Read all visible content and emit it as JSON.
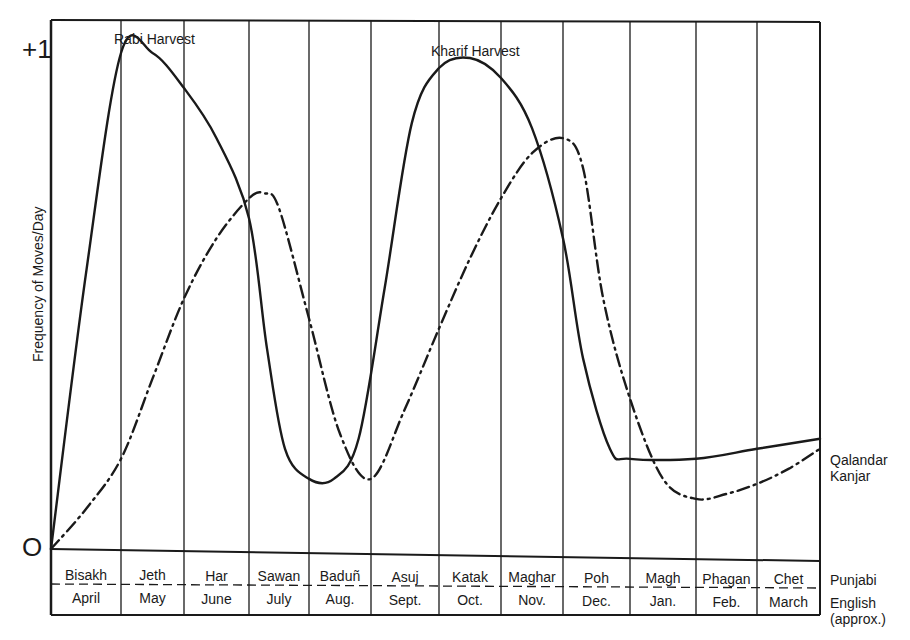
{
  "chart_data": {
    "type": "line",
    "title": "",
    "xlabel": "",
    "ylabel": "Frequency of Moves/Day",
    "ylim": [
      0,
      1
    ],
    "ytick_labels": [
      "O",
      "+1"
    ],
    "grid": "vertical lines at month boundaries",
    "categories_punjabi": [
      "Bisakh",
      "Jeth",
      "Har",
      "Sawan",
      "Baduñ",
      "Asuj",
      "Katak",
      "Maghar",
      "Poh",
      "Magh",
      "Phagan",
      "Chet"
    ],
    "categories_english": [
      "April",
      "May",
      "June",
      "July",
      "Aug.",
      "Sept.",
      "Oct.",
      "Nov.",
      "Dec.",
      "Jan.",
      "Feb.",
      "March"
    ],
    "row_labels": [
      "Punjabi",
      "English (approx.)"
    ],
    "x_unit": "month index (0 = start of Bisakh/April, 12 = end of Chet/March)",
    "series": [
      {
        "name": "Qalandar",
        "style": "solid",
        "x": [
          0,
          0.5,
          1.0,
          1.5,
          2.0,
          2.5,
          3.0,
          3.3,
          3.6,
          4.0,
          4.4,
          4.8,
          5.2,
          5.6,
          6.0,
          6.5,
          7.0,
          7.5,
          8.0,
          8.3,
          8.7,
          9.0,
          10.0,
          11.0,
          12.0
        ],
        "values": [
          0,
          0.55,
          0.99,
          0.99,
          0.92,
          0.82,
          0.66,
          0.4,
          0.2,
          0.14,
          0.14,
          0.22,
          0.52,
          0.85,
          0.96,
          0.98,
          0.94,
          0.84,
          0.62,
          0.38,
          0.2,
          0.18,
          0.18,
          0.2,
          0.22
        ],
        "annotations": [
          {
            "text": "Rabi Harvest",
            "at_x": 1.5,
            "near_value": 1.0
          },
          {
            "text": "Kharif Harvest",
            "at_x": 6.5,
            "near_value": 0.96
          }
        ]
      },
      {
        "name": "Kanjar",
        "style": "dash-dot",
        "x": [
          0,
          0.5,
          1.0,
          1.5,
          2.0,
          2.5,
          3.0,
          3.25,
          3.5,
          4.0,
          4.5,
          5.0,
          5.5,
          6.0,
          6.5,
          7.0,
          7.5,
          8.0,
          8.3,
          8.6,
          9.0,
          9.5,
          10.0,
          10.5,
          11.0,
          11.5,
          12.0
        ],
        "values": [
          0,
          0.08,
          0.18,
          0.34,
          0.5,
          0.62,
          0.7,
          0.71,
          0.68,
          0.46,
          0.23,
          0.14,
          0.28,
          0.44,
          0.58,
          0.7,
          0.79,
          0.82,
          0.76,
          0.5,
          0.3,
          0.14,
          0.1,
          0.11,
          0.13,
          0.16,
          0.2
        ]
      }
    ],
    "legend": {
      "position": "right end of curves",
      "entries": [
        "Qalandar",
        "Kanjar"
      ]
    }
  },
  "labels": {
    "y_axis": "Frequency of Moves/Day",
    "y_top": "+1",
    "y_zero": "O",
    "rabi": "Rabi Harvest",
    "kharif": "Kharif Harvest",
    "legend_qalandar": "Qalandar",
    "legend_kanjar": "Kanjar",
    "row_punjabi": "Punjabi",
    "row_english_1": "English",
    "row_english_2": "(approx.)"
  }
}
